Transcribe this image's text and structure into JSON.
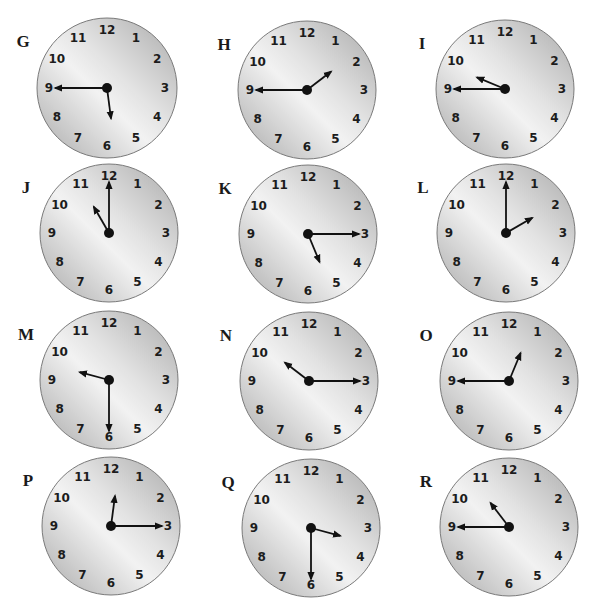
{
  "face_numbers": [
    "12",
    "1",
    "2",
    "3",
    "4",
    "5",
    "6",
    "7",
    "8",
    "9",
    "10",
    "11"
  ],
  "colors": {
    "face_light": "#f2f2f2",
    "face_dark": "#a9a9a9",
    "rim": "#7a7a7a",
    "hand": "#111111",
    "label": "#1a1a1a"
  },
  "clocks": [
    {
      "label": "G",
      "hour": 5,
      "minute": 45,
      "cx": 107,
      "cy": 88,
      "r": 70
    },
    {
      "label": "H",
      "hour": 1,
      "minute": 45,
      "cx": 307,
      "cy": 90,
      "r": 69
    },
    {
      "label": "I",
      "hour": 9,
      "minute": 45,
      "cx": 505,
      "cy": 89,
      "r": 69
    },
    {
      "label": "J",
      "hour": 11,
      "minute": 0,
      "cx": 109,
      "cy": 233,
      "r": 69
    },
    {
      "label": "K",
      "hour": 5,
      "minute": 15,
      "cx": 308,
      "cy": 234,
      "r": 69
    },
    {
      "label": "L",
      "hour": 2,
      "minute": 0,
      "cx": 506,
      "cy": 233,
      "r": 69
    },
    {
      "label": "M",
      "hour": 9,
      "minute": 30,
      "cx": 109,
      "cy": 380,
      "r": 69
    },
    {
      "label": "N",
      "hour": 10,
      "minute": 15,
      "cx": 309,
      "cy": 381,
      "r": 69
    },
    {
      "label": "O",
      "hour": 12,
      "minute": 45,
      "cx": 509,
      "cy": 381,
      "r": 69
    },
    {
      "label": "P",
      "hour": 12,
      "minute": 15,
      "cx": 111,
      "cy": 526,
      "r": 69
    },
    {
      "label": "Q",
      "hour": 3,
      "minute": 30,
      "cx": 311,
      "cy": 528,
      "r": 69
    },
    {
      "label": "R",
      "hour": 10,
      "minute": 45,
      "cx": 509,
      "cy": 527,
      "r": 69
    }
  ]
}
